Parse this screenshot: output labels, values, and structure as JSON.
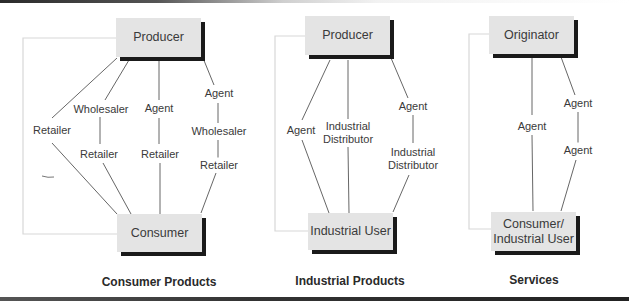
{
  "colors": {
    "box_fill": "#e4e4e4",
    "box_shadow": "#1a1a1a",
    "line": "#555555",
    "bracket": "#d8d8d8",
    "text": "#3a3a3a"
  },
  "panels": [
    {
      "caption": "Consumer Products",
      "top_node": "Producer",
      "bottom_node": "Consumer",
      "channels": [
        {
          "intermediaries": [
            "Retailer"
          ]
        },
        {
          "intermediaries": [
            "Wholesaler",
            "Retailer"
          ]
        },
        {
          "intermediaries": [
            "Agent",
            "Retailer"
          ]
        },
        {
          "intermediaries": [
            "Agent",
            "Wholesaler",
            "Retailer"
          ]
        }
      ]
    },
    {
      "caption": "Industrial Products",
      "top_node": "Producer",
      "bottom_node": "Industrial User",
      "channels": [
        {
          "intermediaries": [
            "Agent"
          ]
        },
        {
          "intermediaries": [
            "Industrial Distributor"
          ]
        },
        {
          "intermediaries": [
            "Agent",
            "Industrial Distributor"
          ]
        }
      ],
      "labels": {
        "agent_left": "Agent",
        "dist_mid_1": "Industrial",
        "dist_mid_2": "Distributor",
        "agent_right": "Agent",
        "dist_right_1": "Industrial",
        "dist_right_2": "Distributor"
      }
    },
    {
      "caption": "Services",
      "top_node": "Originator",
      "bottom_node_line1": "Consumer/",
      "bottom_node_line2": "Industrial User",
      "channels": [
        {
          "intermediaries": [
            "Agent"
          ]
        },
        {
          "intermediaries": [
            "Agent",
            "Agent"
          ]
        }
      ]
    }
  ]
}
